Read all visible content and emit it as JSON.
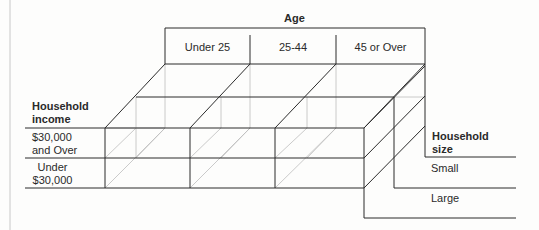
{
  "diagram": {
    "title": "Age",
    "age_groups": [
      "Under 25",
      "25-44",
      "45 or Over"
    ],
    "income": {
      "heading_line1": "Household",
      "heading_line2": "income",
      "rows": [
        {
          "line1": "$30,000",
          "line2": "and Over"
        },
        {
          "line1": "Under",
          "line2": "$30,000"
        }
      ]
    },
    "size": {
      "heading_line1": "Household",
      "heading_line2": "size",
      "rows": [
        "Small",
        "Large"
      ]
    },
    "colors": {
      "line": "#2b2b2b",
      "hidden_line": "#b8b8b8",
      "background": "#fdfdfc"
    }
  }
}
